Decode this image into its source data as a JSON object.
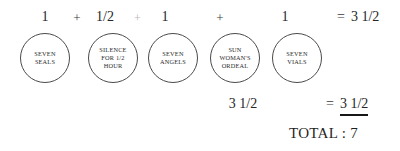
{
  "diagram": {
    "equation_row": {
      "terms": [
        {
          "value": "1"
        },
        {
          "value": "1/2"
        },
        {
          "value": "1"
        },
        {
          "value": "1"
        }
      ],
      "operators": [
        {
          "symbol": "+",
          "state": "normal"
        },
        {
          "symbol": "+",
          "state": "faded"
        },
        {
          "symbol": "+",
          "state": "normal"
        }
      ],
      "result": {
        "equals": "=",
        "value": "3 1/2"
      }
    },
    "nodes": [
      {
        "id": "seven-seals",
        "lines": [
          "SEVEN",
          "SEALS"
        ]
      },
      {
        "id": "silence",
        "lines": [
          "SILENCE",
          "FOR 1/2",
          "HOUR"
        ]
      },
      {
        "id": "seven-angels",
        "lines": [
          "SEVEN",
          "ANGELS"
        ]
      },
      {
        "id": "sun-woman",
        "lines": [
          "SUN",
          "WOMAN'S",
          "ORDEAL"
        ]
      },
      {
        "id": "seven-vials",
        "lines": [
          "SEVEN",
          "VIALS"
        ]
      }
    ],
    "subtotal": "3 1/2",
    "grand_total": {
      "equals": "=",
      "value": "3 1/2"
    },
    "total_label": "TOTAL : 7"
  }
}
